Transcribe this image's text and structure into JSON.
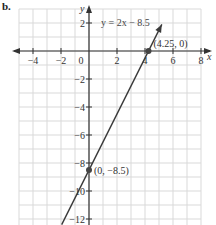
{
  "part_label": "b.",
  "chart_data": {
    "type": "line",
    "title": "",
    "equation_label": "y = 2x − 8.5",
    "xlabel": "x",
    "ylabel": "y",
    "xlim": [
      -5,
      8
    ],
    "ylim": [
      -12.5,
      3
    ],
    "x_ticks": [
      -4,
      -2,
      0,
      2,
      4,
      6,
      8
    ],
    "x_tick_labels": [
      "−4",
      "−2",
      "0",
      "2",
      "4",
      "6",
      "8"
    ],
    "y_ticks": [
      2,
      -2,
      -4,
      -6,
      -8,
      -10,
      -12
    ],
    "y_tick_labels": [
      "2",
      "−2",
      "−4",
      "−6",
      "−8",
      "−10",
      "−12"
    ],
    "grid": true,
    "grid_step": 1,
    "series": [
      {
        "name": "y = 2x − 8.5",
        "slope": 2,
        "intercept": -8.5,
        "x": [
          -1.95,
          5.2
        ],
        "y": [
          -12.4,
          1.9
        ]
      }
    ],
    "points": [
      {
        "label": "(4.25, 0)",
        "x": 4.25,
        "y": 0
      },
      {
        "label": "(0, −8.5)",
        "x": 0,
        "y": -8.5
      }
    ]
  },
  "colors": {
    "grid": "#d9d9d9",
    "axis": "#333333",
    "line": "#3a3a3a",
    "point": "#444444"
  }
}
